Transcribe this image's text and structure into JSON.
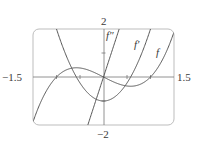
{
  "chart_data": {
    "type": "line",
    "title": "",
    "xlabel": "",
    "ylabel": "",
    "xlim": [
      -1.5,
      1.5
    ],
    "ylim": [
      -2,
      2
    ],
    "grid": false,
    "legend": "inline labels near curves",
    "tick_labels": {
      "x_min": "−1.5",
      "x_max": "1.5",
      "y_max": "2",
      "y_min": "−2"
    },
    "x_ticks": [
      -1,
      -0.5,
      0.5,
      1
    ],
    "y_ticks": [
      -1,
      1
    ],
    "series": [
      {
        "name": "f",
        "label": "f",
        "expression": "x^3 - x",
        "x": [
          -1.5,
          -1.25,
          -1,
          -0.75,
          -0.577,
          -0.5,
          -0.25,
          0,
          0.25,
          0.5,
          0.577,
          0.75,
          1,
          1.25,
          1.5
        ],
        "values": [
          -1.875,
          -0.703,
          0,
          0.328,
          0.385,
          0.375,
          0.234,
          0,
          -0.234,
          -0.375,
          -0.385,
          -0.328,
          0,
          0.703,
          1.875
        ]
      },
      {
        "name": "f'",
        "label": "f′",
        "expression": "3x^2 - 1",
        "x": [
          -1.5,
          -1.25,
          -1,
          -0.75,
          -0.5,
          -0.25,
          0,
          0.25,
          0.5,
          0.75,
          1,
          1.25,
          1.5
        ],
        "values": [
          5.75,
          3.688,
          2,
          0.688,
          -0.25,
          -0.813,
          -1,
          -0.813,
          -0.25,
          0.688,
          2,
          3.688,
          5.75
        ]
      },
      {
        "name": "f''",
        "label": "f″",
        "expression": "6x",
        "x": [
          -1.5,
          -1,
          -0.5,
          -0.333,
          0,
          0.333,
          0.5,
          1,
          1.5
        ],
        "values": [
          -9,
          -6,
          -3,
          -2,
          0,
          2,
          3,
          6,
          9
        ]
      }
    ],
    "colors": {
      "curve": "#555555",
      "axis": "#777777",
      "frame": "#bdbdbd",
      "text": "#3a3a3a"
    }
  }
}
